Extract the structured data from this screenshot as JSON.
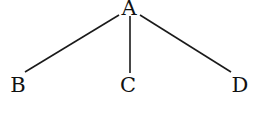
{
  "diagram": {
    "type": "tree",
    "nodes": {
      "root": {
        "label": "A"
      },
      "left": {
        "label": "B"
      },
      "middle": {
        "label": "C"
      },
      "right": {
        "label": "D"
      }
    },
    "edges": [
      [
        "A",
        "B"
      ],
      [
        "A",
        "C"
      ],
      [
        "A",
        "D"
      ]
    ]
  }
}
